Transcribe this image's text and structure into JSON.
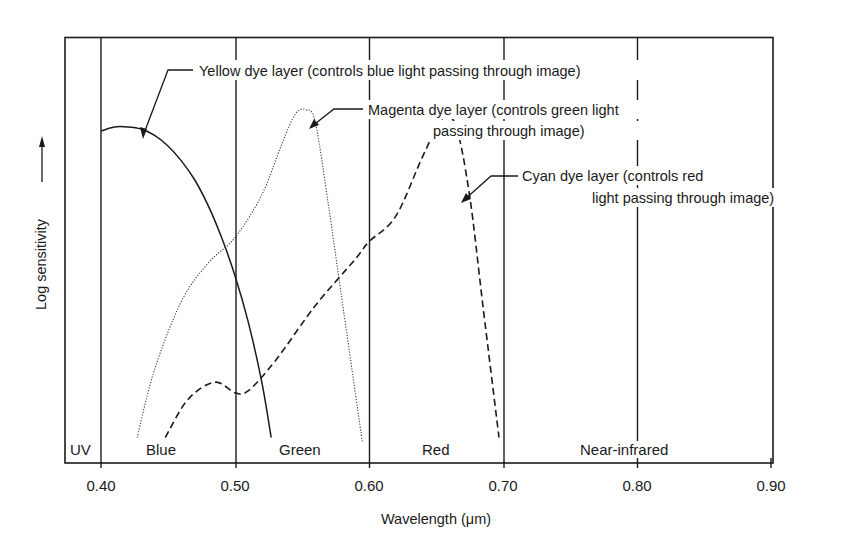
{
  "chart_data": {
    "type": "line",
    "title": "",
    "xlabel": "Wavelength (μm)",
    "ylabel": "Log sensitivity →",
    "xlim": [
      0.375,
      0.905
    ],
    "ylim": [
      0,
      1
    ],
    "grid": false,
    "x_ticks": [
      0.4,
      0.5,
      0.6,
      0.7,
      0.8,
      0.9
    ],
    "x_tick_labels": [
      "0.40",
      "0.50",
      "0.60",
      "0.70",
      "0.80",
      "0.90"
    ],
    "spectral_bands": [
      {
        "label": "UV",
        "from": 0.375,
        "to": 0.4
      },
      {
        "label": "Blue",
        "from": 0.4,
        "to": 0.5
      },
      {
        "label": "Green",
        "from": 0.5,
        "to": 0.6
      },
      {
        "label": "Red",
        "from": 0.6,
        "to": 0.7
      },
      {
        "label": "Near-infrared",
        "from": 0.7,
        "to": 0.9
      }
    ],
    "series": [
      {
        "name": "Yellow dye layer",
        "annotation": [
          "Yellow dye layer (controls blue light passing through image)"
        ],
        "line_style": "solid",
        "x": [
          0.4,
          0.41,
          0.42,
          0.43,
          0.44,
          0.45,
          0.46,
          0.47,
          0.48,
          0.49,
          0.5,
          0.51,
          0.52,
          0.527
        ],
        "y": [
          0.78,
          0.79,
          0.79,
          0.785,
          0.77,
          0.745,
          0.71,
          0.665,
          0.605,
          0.53,
          0.44,
          0.33,
          0.19,
          0.06
        ]
      },
      {
        "name": "Magenta dye layer",
        "annotation": [
          "Magenta dye layer (controls green light",
          "passing through image)"
        ],
        "line_style": "dotted",
        "x": [
          0.427,
          0.44,
          0.46,
          0.48,
          0.5,
          0.52,
          0.535,
          0.545,
          0.553,
          0.56,
          0.57,
          0.58,
          0.59,
          0.595
        ],
        "y": [
          0.06,
          0.22,
          0.38,
          0.47,
          0.53,
          0.63,
          0.75,
          0.82,
          0.83,
          0.8,
          0.6,
          0.38,
          0.16,
          0.05
        ]
      },
      {
        "name": "Cyan dye layer",
        "annotation": [
          "Cyan dye layer (controls red",
          "light passing through image)"
        ],
        "line_style": "dashed",
        "x": [
          0.448,
          0.465,
          0.485,
          0.5,
          0.51,
          0.53,
          0.56,
          0.59,
          0.6,
          0.62,
          0.64,
          0.655,
          0.665,
          0.675,
          0.685,
          0.697
        ],
        "y": [
          0.06,
          0.15,
          0.19,
          0.165,
          0.17,
          0.24,
          0.37,
          0.48,
          0.52,
          0.58,
          0.72,
          0.81,
          0.79,
          0.63,
          0.37,
          0.06
        ]
      }
    ]
  },
  "axis": {
    "xlabel": "Wavelength (μm)",
    "ylabel": "Log sensitivity"
  },
  "ticks": {
    "t040": "0.40",
    "t050": "0.50",
    "t060": "0.60",
    "t070": "0.70",
    "t080": "0.80",
    "t090": "0.90"
  },
  "bands": {
    "uv": "UV",
    "blue": "Blue",
    "green": "Green",
    "red": "Red",
    "nir": "Near-infrared"
  },
  "annotations": {
    "yellow": "Yellow dye layer (controls blue light passing through image)",
    "magenta_1": "Magenta dye layer (controls green light",
    "magenta_2": "passing through image)",
    "cyan_1": "Cyan dye layer (controls red",
    "cyan_2": "light passing through image)"
  },
  "colors": {
    "ink": "#1a1a1a",
    "background": "#ffffff"
  }
}
